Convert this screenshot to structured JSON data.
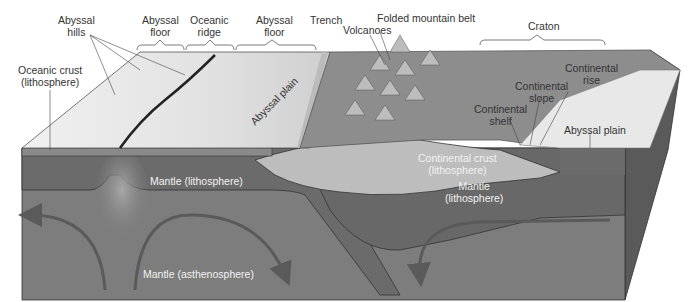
{
  "figure": {
    "labels": {
      "abyssal_hills": [
        "Abyssal",
        "hills"
      ],
      "abyssal_floor_left": [
        "Abyssal",
        "floor"
      ],
      "oceanic_ridge": [
        "Oceanic",
        "ridge"
      ],
      "abyssal_floor_right": [
        "Abyssal",
        "floor"
      ],
      "trench": "Trench",
      "folded_mountain_belt": "Folded mountain belt",
      "volcanoes": "Volcanoes",
      "craton": "Craton",
      "oceanic_crust": [
        "Oceanic crust",
        "(lithosphere)"
      ],
      "abyssal_plain_surface": "Abyssal plain",
      "continental_rise": [
        "Continental",
        "rise"
      ],
      "continental_slope": [
        "Continental",
        "slope"
      ],
      "continental_shelf": [
        "Continental",
        "shelf"
      ],
      "abyssal_plain_right": "Abyssal plain",
      "continental_crust": [
        "Continental crust",
        "(lithosphere)"
      ],
      "mantle_lithosphere_left": "Mantle (lithosphere)",
      "mantle_lithosphere_right": [
        "Mantle",
        "(lithosphere)"
      ],
      "mantle_asthenosphere": "Mantle (asthenosphere)"
    },
    "colors": {
      "ocean_floor": "#e6e6e6",
      "continent_surface": "#8a8a8a",
      "continental_crust": "#bdbdbd",
      "lithosphere": "#6e6e6e",
      "asthenosphere": "#7d7d7d",
      "side_face": "#5a5a5a",
      "arrow": "#555555",
      "label_text": "#333333"
    }
  }
}
